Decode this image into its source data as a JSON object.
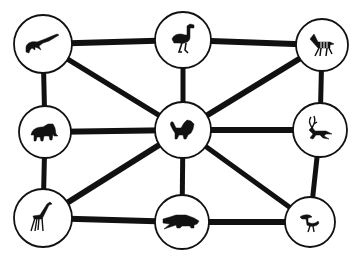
{
  "diagram": {
    "type": "graph",
    "background": "#ffffff",
    "ink_color": "#111111",
    "nodes": [
      {
        "id": "crocodile",
        "label": "crocodile",
        "cx": 43,
        "cy": 44,
        "r": 29
      },
      {
        "id": "ostrich",
        "label": "ostrich",
        "cx": 183,
        "cy": 40,
        "r": 28
      },
      {
        "id": "zebra",
        "label": "zebra",
        "cx": 322,
        "cy": 45,
        "r": 26
      },
      {
        "id": "elephant",
        "label": "elephant",
        "cx": 45,
        "cy": 132,
        "r": 26
      },
      {
        "id": "lion",
        "label": "lion",
        "cx": 183,
        "cy": 130,
        "r": 28
      },
      {
        "id": "antelope",
        "label": "antelope",
        "cx": 320,
        "cy": 130,
        "r": 27
      },
      {
        "id": "giraffe",
        "label": "giraffe",
        "cx": 43,
        "cy": 218,
        "r": 29
      },
      {
        "id": "hippo",
        "label": "hippopotamus",
        "cx": 182,
        "cy": 222,
        "r": 27
      },
      {
        "id": "bird",
        "label": "bird",
        "cx": 310,
        "cy": 222,
        "r": 25
      }
    ],
    "edges": [
      {
        "from": "crocodile",
        "to": "ostrich",
        "w": 6
      },
      {
        "from": "ostrich",
        "to": "zebra",
        "w": 6
      },
      {
        "from": "crocodile",
        "to": "elephant",
        "w": 5
      },
      {
        "from": "ostrich",
        "to": "lion",
        "w": 5
      },
      {
        "from": "zebra",
        "to": "antelope",
        "w": 5
      },
      {
        "from": "elephant",
        "to": "lion",
        "w": 6
      },
      {
        "from": "lion",
        "to": "antelope",
        "w": 6
      },
      {
        "from": "elephant",
        "to": "giraffe",
        "w": 5
      },
      {
        "from": "lion",
        "to": "hippo",
        "w": 5
      },
      {
        "from": "antelope",
        "to": "bird",
        "w": 5
      },
      {
        "from": "giraffe",
        "to": "hippo",
        "w": 6
      },
      {
        "from": "hippo",
        "to": "bird",
        "w": 6
      },
      {
        "from": "crocodile",
        "to": "lion",
        "w": 5
      },
      {
        "from": "zebra",
        "to": "lion",
        "w": 6
      },
      {
        "from": "giraffe",
        "to": "lion",
        "w": 6
      },
      {
        "from": "bird",
        "to": "lion",
        "w": 5
      }
    ]
  }
}
